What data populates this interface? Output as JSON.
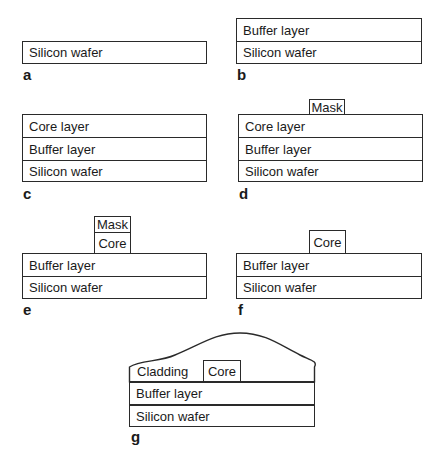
{
  "panels": {
    "a": {
      "label": "a",
      "layers": [
        "Silicon wafer"
      ]
    },
    "b": {
      "label": "b",
      "layers": [
        "Buffer layer",
        "Silicon wafer"
      ]
    },
    "c": {
      "label": "c",
      "layers": [
        "Core layer",
        "Buffer layer",
        "Silicon wafer"
      ]
    },
    "d": {
      "label": "d",
      "mask": "Mask",
      "layers": [
        "Core layer",
        "Buffer layer",
        "Silicon wafer"
      ]
    },
    "e": {
      "label": "e",
      "mask": "Mask",
      "core": "Core",
      "layers": [
        "Buffer layer",
        "Silicon wafer"
      ]
    },
    "f": {
      "label": "f",
      "core": "Core",
      "layers": [
        "Buffer layer",
        "Silicon wafer"
      ]
    },
    "g": {
      "label": "g",
      "cladding": "Cladding",
      "core": "Core",
      "layers": [
        "Buffer layer",
        "Silicon wafer"
      ]
    }
  }
}
